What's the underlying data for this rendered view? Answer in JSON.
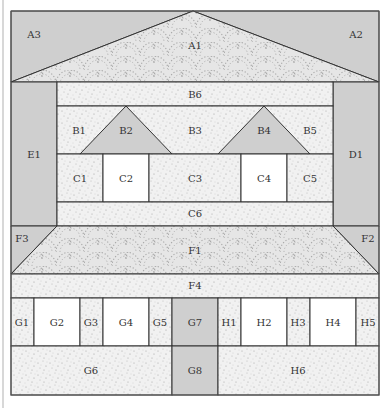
{
  "colors": {
    "gray_fill": "#cfcfcf",
    "speckle_fill": "#efefef",
    "white_fill": "#ffffff",
    "scallop_fill": "#e4e4e4",
    "stroke": "#333333"
  },
  "pieces": {
    "A1": "A1",
    "A2": "A2",
    "A3": "A3",
    "B1": "B1",
    "B2": "B2",
    "B3": "B3",
    "B4": "B4",
    "B5": "B5",
    "B6": "B6",
    "C1": "C1",
    "C2": "C2",
    "C3": "C3",
    "C4": "C4",
    "C5": "C5",
    "C6": "C6",
    "D1": "D1",
    "E1": "E1",
    "F1": "F1",
    "F2": "F2",
    "F3": "F3",
    "F4": "F4",
    "G1": "G1",
    "G2": "G2",
    "G3": "G3",
    "G4": "G4",
    "G5": "G5",
    "G6": "G6",
    "G7": "G7",
    "G8": "G8",
    "H1": "H1",
    "H2": "H2",
    "H3": "H3",
    "H4": "H4",
    "H5": "H5",
    "H6": "H6"
  },
  "sections": [
    {
      "name": "roof",
      "pieces": [
        "A1",
        "A2",
        "A3"
      ]
    },
    {
      "name": "upper-story",
      "pieces": [
        "B1",
        "B2",
        "B3",
        "B4",
        "B5",
        "B6",
        "C1",
        "C2",
        "C3",
        "C4",
        "C5",
        "C6",
        "D1",
        "E1"
      ]
    },
    {
      "name": "lower-roof",
      "pieces": [
        "F1",
        "F2",
        "F3",
        "F4"
      ]
    },
    {
      "name": "ground-floor-left",
      "pieces": [
        "G1",
        "G2",
        "G3",
        "G4",
        "G5",
        "G6",
        "G7",
        "G8"
      ]
    },
    {
      "name": "ground-floor-right",
      "pieces": [
        "H1",
        "H2",
        "H3",
        "H4",
        "H5",
        "H6"
      ]
    }
  ]
}
